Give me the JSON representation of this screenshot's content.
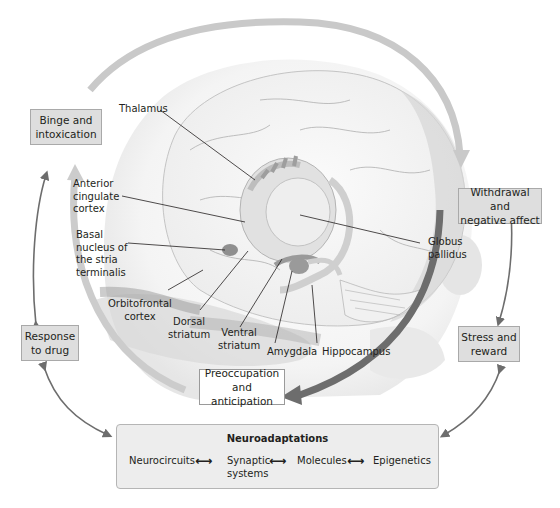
{
  "diagram": {
    "stages": {
      "binge": "Binge and\nintoxication",
      "withdrawal": "Withdrawal and\nnegative affect",
      "preoccupation": "Preoccupation\nand anticipation"
    },
    "side_boxes": {
      "response": "Response\nto drug",
      "stress": "Stress and\nreward"
    },
    "brain_labels": {
      "thalamus": "Thalamus",
      "anterior_cingulate": "Anterior\ncingulate\ncortex",
      "basal_nucleus": "Basal\nnucleus of\nthe stria\nterminalis",
      "orbitofrontal": "Orbitofrontal\ncortex",
      "dorsal_striatum": "Dorsal\nstriatum",
      "ventral_striatum": "Ventral\nstriatum",
      "amygdala": "Amygdala",
      "hippocampus": "Hippocampus",
      "globus_pallidus": "Globus\npallidus"
    },
    "neuroadaptations": {
      "title": "Neuroadaptations",
      "items": [
        "Neurocircuits",
        "Synaptic\nsystems",
        "Molecules",
        "Epigenetics"
      ],
      "connector": "⟷"
    },
    "colors": {
      "cycle_light": "#c9c9c9",
      "cycle_dark": "#6d6d6d",
      "box_fill": "#dedede",
      "neuro_fill": "#ededed"
    }
  }
}
